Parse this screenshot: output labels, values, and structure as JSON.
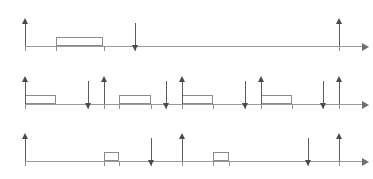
{
  "figure": {
    "axis_variable": "t",
    "scale": {
      "x_origin_px": 25,
      "px_per_unit": 15.7,
      "t_min": 0,
      "t_max": 20
    }
  },
  "timelines": [
    {
      "name": "tau-1",
      "label_tau": "τ",
      "label_index": "1",
      "label_params": "(r0 = 0, C = 3, D = 7, T = 20)",
      "label_text": "τ1(r0 = 0, C = 3, D = 7, T = 20)",
      "params": {
        "r0": 0,
        "C": 3,
        "D": 7,
        "T": 20
      },
      "tick_values": [
        0,
        2,
        5,
        7,
        20
      ],
      "tick_labels": [
        "0",
        "2",
        "5",
        "7",
        "20"
      ],
      "release_arrows": [
        0,
        20
      ],
      "deadline_arrows": [
        7
      ],
      "execution_blocks": [
        {
          "start": 2,
          "end": 5
        }
      ]
    },
    {
      "name": "tau-2",
      "label_tau": "τ",
      "label_index": "2",
      "label_params": "(r0 = 0, C = 2, D = 4, T = 5)",
      "label_text": "τ2(r0 = 0, C = 2, D = 4, T = 5)",
      "params": {
        "r0": 0,
        "C": 2,
        "D": 4,
        "T": 5
      },
      "tick_values": [
        0,
        4,
        5,
        6,
        8,
        9,
        10,
        12,
        14,
        15,
        17,
        19,
        20
      ],
      "tick_labels": [
        "0",
        "4",
        "5",
        "6",
        "8",
        "9",
        "10",
        "12",
        "14",
        "15",
        "17",
        "19",
        "20"
      ],
      "release_arrows": [
        0,
        5,
        10,
        15,
        20
      ],
      "deadline_arrows": [
        4,
        9,
        14,
        19
      ],
      "execution_blocks": [
        {
          "start": 0,
          "end": 2
        },
        {
          "start": 6,
          "end": 8
        },
        {
          "start": 10,
          "end": 12
        },
        {
          "start": 15,
          "end": 17
        }
      ]
    },
    {
      "name": "tau-3",
      "label_tau": "τ",
      "label_index": "3",
      "label_params": "(r0 = 0, C = 1, D = 8, T = 10)",
      "label_text": "τ3(r0 = 0, C = 1, D = 8, T = 10)",
      "params": {
        "r0": 0,
        "C": 1,
        "D": 8,
        "T": 10
      },
      "tick_values": [
        0,
        5,
        6,
        8,
        10,
        12,
        13,
        18,
        20
      ],
      "tick_labels": [
        "0",
        "5",
        "6",
        "8",
        "10",
        "12",
        "13",
        "18",
        "20"
      ],
      "release_arrows": [
        0,
        10,
        20
      ],
      "deadline_arrows": [
        8,
        18
      ],
      "execution_blocks": [
        {
          "start": 5,
          "end": 6
        },
        {
          "start": 12,
          "end": 13
        }
      ]
    }
  ],
  "chart_data": {
    "type": "timeline",
    "title": "",
    "xlabel": "t",
    "xlim": [
      0,
      20
    ],
    "grid": false,
    "legend": "none",
    "series": [
      {
        "name": "τ1(r0 = 0, C = 3, D = 7, T = 20)",
        "releases": [
          0,
          20
        ],
        "deadlines": [
          7
        ],
        "execution_intervals": [
          [
            2,
            5
          ]
        ]
      },
      {
        "name": "τ2(r0 = 0, C = 2, D = 4, T = 5)",
        "releases": [
          0,
          5,
          10,
          15,
          20
        ],
        "deadlines": [
          4,
          9,
          14,
          19
        ],
        "execution_intervals": [
          [
            0,
            2
          ],
          [
            6,
            8
          ],
          [
            10,
            12
          ],
          [
            15,
            17
          ]
        ]
      },
      {
        "name": "τ3(r0 = 0, C = 1, D = 8, T = 10)",
        "releases": [
          0,
          10,
          20
        ],
        "deadlines": [
          8,
          18
        ],
        "execution_intervals": [
          [
            5,
            6
          ],
          [
            12,
            13
          ]
        ]
      }
    ]
  }
}
